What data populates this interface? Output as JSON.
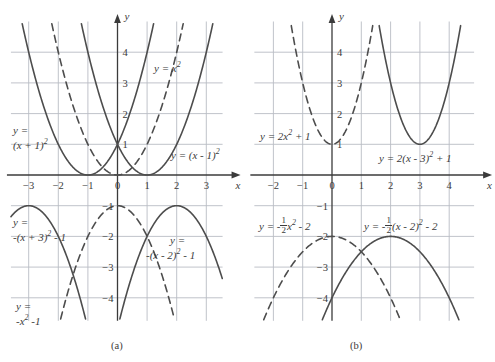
{
  "figure": {
    "title_a": "(a)",
    "title_b": "(b)",
    "colors": {
      "curve": "#4d4d4d",
      "grid": "#b9bcc4",
      "axis": "#3b3b3b",
      "text": "#3b3b3b",
      "background": "#ffffff"
    }
  },
  "panel_a": {
    "caption": "(a)",
    "x_axis_label": "x",
    "y_axis_label": "y",
    "x_ticks": [
      "-3",
      "-2",
      "-1",
      "0",
      "1",
      "2",
      "3"
    ],
    "y_ticks_upper": [
      "1",
      "2",
      "3",
      "4"
    ],
    "y_ticks_lower": [
      "-1",
      "-2",
      "-3",
      "-4"
    ],
    "labels": {
      "x_squared": "y = x",
      "x_squared_exp": "2",
      "shift_left_l1": "y =",
      "shift_left_l2": "(x + 1)",
      "shift_left_exp": "2",
      "shift_right": "y = (x - 1)",
      "shift_right_exp": "2",
      "down_left_l1": "y =",
      "down_left_l2": "-(x + 3)",
      "down_left_exp": "2",
      "down_left_tail": "- 1",
      "neg_x2_l1": "y =",
      "neg_x2_l2": "-x",
      "neg_x2_exp": "2",
      "neg_x2_tail": "-1",
      "down_right_l1": "y =",
      "down_right_l2": "-(x - 2)",
      "down_right_exp": "2",
      "down_right_tail": "- 1"
    }
  },
  "panel_b": {
    "caption": "(b)",
    "x_axis_label": "x",
    "y_axis_label": "y",
    "x_ticks": [
      "-2",
      "-1",
      "0",
      "1",
      "2",
      "3",
      "4"
    ],
    "y_ticks_upper": [
      "1",
      "2",
      "3",
      "4"
    ],
    "y_ticks_lower": [
      "-1",
      "-2",
      "-3",
      "-4"
    ],
    "labels": {
      "two_x2_plus1": "y = 2x",
      "two_x2_plus1_exp": "2",
      "two_x2_plus1_tail": "+ 1",
      "two_shift": "y = 2(x - 3)",
      "two_shift_exp": "2",
      "two_shift_tail": "+ 1",
      "half_neg_pre": "y = -",
      "half_neg_num": "1",
      "half_neg_den": "2",
      "half_neg_post": "x",
      "half_neg_exp": "2",
      "half_neg_tail": "- 2",
      "half_shift_pre": "y = -",
      "half_shift_num": "1",
      "half_shift_den": "2",
      "half_shift_post": "(x - 2)",
      "half_shift_exp": "2",
      "half_shift_tail": "- 2"
    }
  },
  "chart_data": [
    {
      "type": "line",
      "title": "(a) upper: vertical shifts of y = x^2",
      "xlabel": "x",
      "ylabel": "y",
      "xlim": [
        -3.6,
        3.6
      ],
      "ylim": [
        -0.25,
        5.0
      ],
      "grid": true,
      "series": [
        {
          "name": "y = x^2",
          "style": "dashed",
          "a": 1,
          "h": 0,
          "k": 0
        },
        {
          "name": "y = (x + 1)^2",
          "style": "solid",
          "a": 1,
          "h": -1,
          "k": 0
        },
        {
          "name": "y = (x - 1)^2",
          "style": "solid",
          "a": 1,
          "h": 1,
          "k": 0
        }
      ]
    },
    {
      "type": "line",
      "title": "(a) lower: reflections and shifts of y = -x^2 - 1",
      "xlabel": "x",
      "ylabel": "y",
      "xlim": [
        -3.6,
        3.6
      ],
      "ylim": [
        -4.75,
        -0.5
      ],
      "grid": true,
      "series": [
        {
          "name": "y = -x^2 - 1",
          "style": "dashed",
          "a": -1,
          "h": 0,
          "k": -1
        },
        {
          "name": "y = -(x + 3)^2 - 1",
          "style": "solid",
          "a": -1,
          "h": -3,
          "k": -1
        },
        {
          "name": "y = -(x - 2)^2 - 1",
          "style": "solid",
          "a": -1,
          "h": 2,
          "k": -1
        }
      ]
    },
    {
      "type": "line",
      "title": "(b) upper: horizontal shift of y = 2x^2 + 1",
      "xlabel": "x",
      "ylabel": "y",
      "xlim": [
        -2.6,
        4.8
      ],
      "ylim": [
        -0.25,
        5.0
      ],
      "grid": true,
      "series": [
        {
          "name": "y = 2x^2 + 1",
          "style": "dashed",
          "a": 2,
          "h": 0,
          "k": 1
        },
        {
          "name": "y = 2(x - 3)^2 + 1",
          "style": "solid",
          "a": 2,
          "h": 3,
          "k": 1
        }
      ]
    },
    {
      "type": "line",
      "title": "(b) lower: horizontal shift of y = -1/2 x^2 - 2",
      "xlabel": "x",
      "ylabel": "y",
      "xlim": [
        -2.6,
        4.8
      ],
      "ylim": [
        -4.75,
        -0.5
      ],
      "grid": true,
      "series": [
        {
          "name": "y = -1/2 x^2 - 2",
          "style": "dashed",
          "a": -0.5,
          "h": 0,
          "k": -2
        },
        {
          "name": "y = -1/2 (x - 2)^2 - 2",
          "style": "solid",
          "a": -0.5,
          "h": 2,
          "k": -2
        }
      ]
    }
  ]
}
